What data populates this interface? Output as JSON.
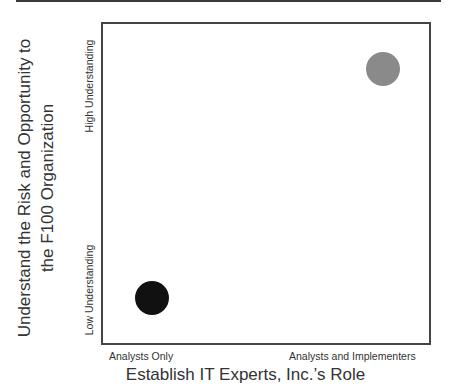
{
  "chart_data": {
    "type": "scatter",
    "title": "",
    "xlabel": "Establish IT Experts, Inc.’s Role",
    "ylabel_line1": "Understand the Risk and Opportunity to",
    "ylabel_line2": "the F100 Organization",
    "x_tick_labels": {
      "low": "Analysts Only",
      "high": "Analysts and Implementers"
    },
    "y_tick_labels": {
      "low": "Low Understanding",
      "high": "High Understanding"
    },
    "grid": false,
    "legend": null,
    "points": [
      {
        "x": 0.15,
        "y": 0.14,
        "color": "#111111",
        "label": ""
      },
      {
        "x": 0.86,
        "y": 0.86,
        "color": "#8a8a8a",
        "label": ""
      }
    ],
    "xlim": [
      0,
      1
    ],
    "ylim": [
      0,
      1
    ]
  }
}
